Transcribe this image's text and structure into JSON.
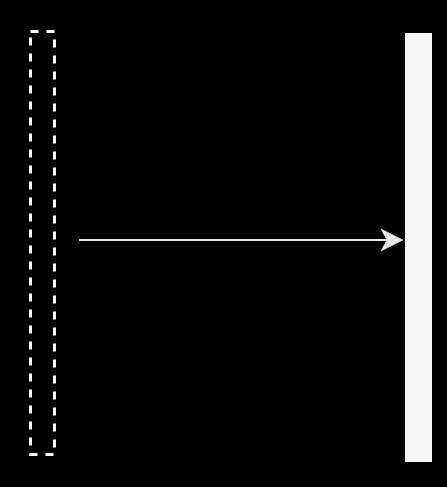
{
  "canvas": {
    "width": 447,
    "height": 487,
    "background_color": "#000000"
  },
  "palette": {
    "background": "#000000",
    "stroke_white": "#ffffff",
    "bar_fill": "#f5f5f5",
    "arrow_color": "#e8e8e8"
  },
  "diagram": {
    "type": "schematic",
    "title": "",
    "shapes": [
      {
        "name": "dashed-rectangle",
        "role": "outlined-region",
        "style": "dashed-outline",
        "stroke_color": "#ffffff",
        "stroke_width": 3,
        "dash_length": 8,
        "gap_length": 8,
        "fill": "none",
        "x": 29,
        "y": 30,
        "width": 27,
        "height": 426
      },
      {
        "name": "solid-bar",
        "role": "filled-region",
        "style": "solid-fill",
        "fill_color": "#f5f5f5",
        "stroke_color": "none",
        "x": 405,
        "y": 33,
        "width": 27,
        "height": 429
      },
      {
        "name": "arrow",
        "role": "direction-indicator",
        "style": "line-with-open-arrowhead",
        "stroke_color": "#e8e8e8",
        "stroke_width": 2,
        "x_start": 79,
        "x_end": 403,
        "y": 240,
        "head_length": 22,
        "head_half_width": 11,
        "head_notch": 6,
        "direction": "right"
      }
    ]
  },
  "labels": {
    "dashed_rect_label": "",
    "solid_bar_label": "",
    "arrow_label": ""
  }
}
